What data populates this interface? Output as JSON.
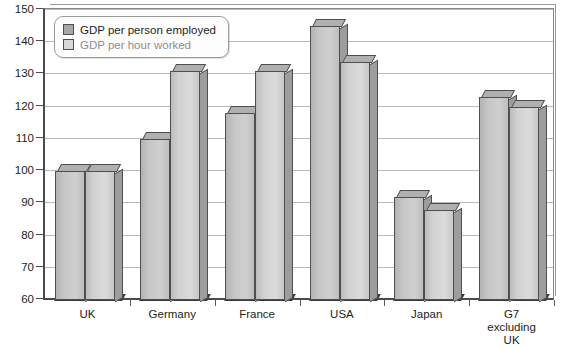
{
  "chart_data": {
    "type": "bar",
    "title": "",
    "xlabel": "",
    "ylabel": "",
    "ylim": [
      60,
      150
    ],
    "ytick_step": 10,
    "yticks": [
      150,
      140,
      130,
      120,
      110,
      100,
      90,
      80,
      70,
      60
    ],
    "grid": true,
    "legend_position": "top-left",
    "categories": [
      "UK",
      "Germany",
      "France",
      "USA",
      "Japan",
      "G7 excluding UK"
    ],
    "series": [
      {
        "name": "GDP per person employed",
        "color": "#c6c6c6",
        "values": [
          100,
          110,
          118,
          145,
          92,
          123
        ]
      },
      {
        "name": "GDP per hour worked",
        "color": "#d8d8d8",
        "values": [
          100,
          131,
          131,
          134,
          88,
          120
        ]
      }
    ]
  },
  "legend": {
    "items": [
      {
        "label": "GDP per person employed",
        "swatch": "dark-swatch-icon"
      },
      {
        "label": "GDP per hour worked",
        "swatch": "light-swatch-icon"
      }
    ]
  },
  "y_axis": {
    "labels": [
      "150",
      "140",
      "130",
      "120",
      "110",
      "100",
      "90",
      "80",
      "70",
      "60"
    ]
  },
  "x_axis": {
    "labels": [
      "UK",
      "Germany",
      "France",
      "USA",
      "Japan",
      "G7\nexcluding\nUK"
    ]
  }
}
